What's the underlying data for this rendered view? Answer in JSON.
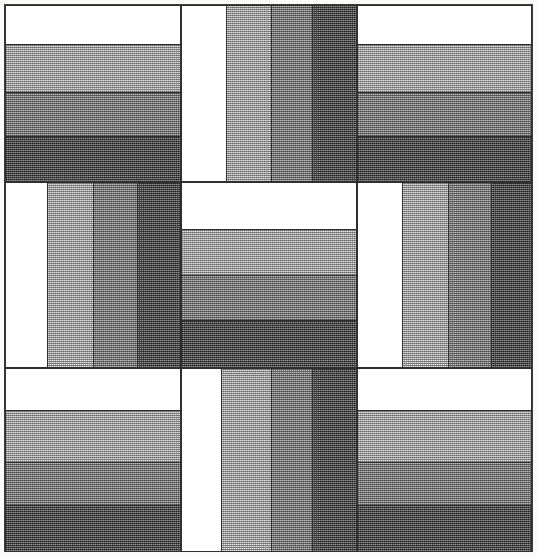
{
  "artwork": {
    "title": "Rail Fence Quilt Block",
    "pattern_name": "Rail Fence",
    "grid": "3x3",
    "strips_per_unit": 4,
    "background_color": "#fbfbfa",
    "frame_color": "#3c3c3c",
    "seam_color": "#2e2e2e",
    "canvas": {
      "width": 537,
      "height": 557
    }
  },
  "palette": {
    "white": {
      "label": "White",
      "hex": "#ffffff",
      "fill_ratio": 0.0
    },
    "light": {
      "label": "Light Gray",
      "hex": "#b6b6b6",
      "fill_ratio": 0.25
    },
    "medium": {
      "label": "Medium Gray",
      "hex": "#8c8c8c",
      "fill_ratio": 0.5
    },
    "dark": {
      "label": "Dark Gray",
      "hex": "#5d5d5d",
      "fill_ratio": 0.75
    }
  },
  "units": [
    {
      "id": "unit-top-left",
      "name": "top-left",
      "row": 0,
      "col": 0,
      "orientation": "horizontal",
      "x": 5,
      "y": 5,
      "width": 176,
      "height": 177,
      "strips": [
        {
          "value": "white",
          "offset": 0,
          "size": 40
        },
        {
          "value": "light",
          "offset": 40,
          "size": 48
        },
        {
          "value": "medium",
          "offset": 88,
          "size": 44
        },
        {
          "value": "dark",
          "offset": 132,
          "size": 45
        }
      ]
    },
    {
      "id": "unit-top-center",
      "name": "top-center",
      "row": 0,
      "col": 1,
      "orientation": "vertical",
      "x": 181,
      "y": 5,
      "width": 176,
      "height": 177,
      "strips": [
        {
          "value": "white",
          "offset": 0,
          "size": 46
        },
        {
          "value": "light",
          "offset": 46,
          "size": 45
        },
        {
          "value": "medium",
          "offset": 91,
          "size": 41
        },
        {
          "value": "dark",
          "offset": 132,
          "size": 44
        }
      ]
    },
    {
      "id": "unit-top-right",
      "name": "top-right",
      "row": 0,
      "col": 2,
      "orientation": "horizontal",
      "x": 357,
      "y": 5,
      "width": 175,
      "height": 177,
      "strips": [
        {
          "value": "white",
          "offset": 0,
          "size": 40
        },
        {
          "value": "light",
          "offset": 40,
          "size": 48
        },
        {
          "value": "medium",
          "offset": 88,
          "size": 44
        },
        {
          "value": "dark",
          "offset": 132,
          "size": 45
        }
      ]
    },
    {
      "id": "unit-middle-left",
      "name": "middle-left",
      "row": 1,
      "col": 0,
      "orientation": "vertical",
      "x": 5,
      "y": 182,
      "width": 176,
      "height": 186,
      "strips": [
        {
          "value": "white",
          "offset": 0,
          "size": 43
        },
        {
          "value": "light",
          "offset": 43,
          "size": 46
        },
        {
          "value": "medium",
          "offset": 89,
          "size": 44
        },
        {
          "value": "dark",
          "offset": 133,
          "size": 43
        }
      ]
    },
    {
      "id": "unit-middle-center",
      "name": "middle-center",
      "row": 1,
      "col": 1,
      "orientation": "horizontal",
      "x": 181,
      "y": 182,
      "width": 176,
      "height": 186,
      "strips": [
        {
          "value": "white",
          "offset": 0,
          "size": 48
        },
        {
          "value": "light",
          "offset": 48,
          "size": 46
        },
        {
          "value": "medium",
          "offset": 94,
          "size": 45
        },
        {
          "value": "dark",
          "offset": 139,
          "size": 47
        }
      ]
    },
    {
      "id": "unit-middle-right",
      "name": "middle-right",
      "row": 1,
      "col": 2,
      "orientation": "vertical",
      "x": 357,
      "y": 182,
      "width": 175,
      "height": 186,
      "strips": [
        {
          "value": "white",
          "offset": 0,
          "size": 46
        },
        {
          "value": "light",
          "offset": 46,
          "size": 46
        },
        {
          "value": "medium",
          "offset": 92,
          "size": 43
        },
        {
          "value": "dark",
          "offset": 135,
          "size": 40
        }
      ]
    },
    {
      "id": "unit-bottom-left",
      "name": "bottom-left",
      "row": 2,
      "col": 0,
      "orientation": "horizontal",
      "x": 5,
      "y": 368,
      "width": 176,
      "height": 184,
      "strips": [
        {
          "value": "white",
          "offset": 0,
          "size": 43
        },
        {
          "value": "light",
          "offset": 43,
          "size": 52
        },
        {
          "value": "medium",
          "offset": 95,
          "size": 43
        },
        {
          "value": "dark",
          "offset": 138,
          "size": 46
        }
      ]
    },
    {
      "id": "unit-bottom-center",
      "name": "bottom-center",
      "row": 2,
      "col": 1,
      "orientation": "vertical",
      "x": 181,
      "y": 368,
      "width": 176,
      "height": 184,
      "strips": [
        {
          "value": "white",
          "offset": 0,
          "size": 41
        },
        {
          "value": "light",
          "offset": 41,
          "size": 50
        },
        {
          "value": "medium",
          "offset": 91,
          "size": 41
        },
        {
          "value": "dark",
          "offset": 132,
          "size": 44
        }
      ]
    },
    {
      "id": "unit-bottom-right",
      "name": "bottom-right",
      "row": 2,
      "col": 2,
      "orientation": "horizontal",
      "x": 357,
      "y": 368,
      "width": 175,
      "height": 184,
      "strips": [
        {
          "value": "white",
          "offset": 0,
          "size": 43
        },
        {
          "value": "light",
          "offset": 43,
          "size": 52
        },
        {
          "value": "medium",
          "offset": 95,
          "size": 43
        },
        {
          "value": "dark",
          "offset": 138,
          "size": 46
        }
      ]
    }
  ]
}
